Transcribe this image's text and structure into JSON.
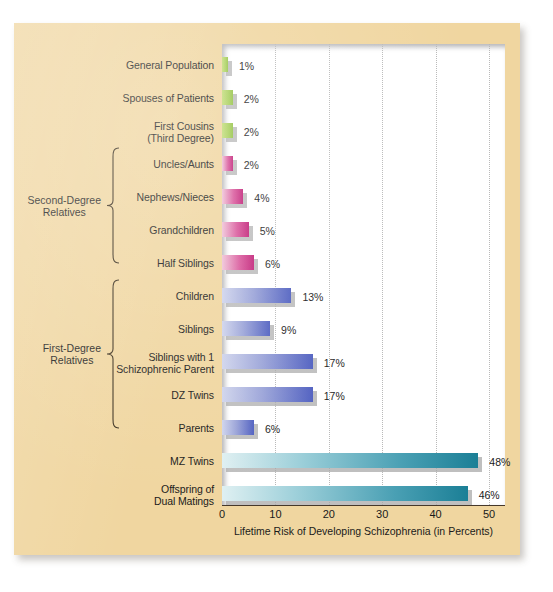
{
  "figure": {
    "background_color": "#f0d6a0",
    "plot_background_color": "#ffffff"
  },
  "axis": {
    "title": "Lifetime Risk of Developing Schizophrenia (in Percents)",
    "ticks": [
      "0",
      "10",
      "20",
      "30",
      "40",
      "50"
    ]
  },
  "groups": [
    {
      "id": "second-degree",
      "label_line1": "Second-Degree",
      "label_line2": "Relatives"
    },
    {
      "id": "first-degree",
      "label_line1": "First-Degree",
      "label_line2": "Relatives"
    }
  ],
  "chart_data": {
    "type": "bar",
    "orientation": "horizontal",
    "title": "",
    "xlabel": "Lifetime Risk of Developing Schizophrenia (in Percents)",
    "ylabel": "",
    "xlim": [
      0,
      53
    ],
    "xticks": [
      0,
      10,
      20,
      30,
      40,
      50
    ],
    "grid": true,
    "grid_axis": "x",
    "legend": "none",
    "categories": [
      "General Population",
      "Spouses of Patients",
      "First Cousins (Third Degree)",
      "Uncles/Aunts",
      "Nephews/Nieces",
      "Grandchildren",
      "Half Siblings",
      "Children",
      "Siblings",
      "Siblings with 1 Schizophrenic Parent",
      "DZ Twins",
      "Parents",
      "MZ Twins",
      "Offspring of Dual Matings"
    ],
    "values": [
      1,
      2,
      2,
      2,
      4,
      5,
      6,
      13,
      9,
      17,
      17,
      6,
      48,
      46
    ],
    "value_labels": [
      "1%",
      "2%",
      "2%",
      "2%",
      "4%",
      "5%",
      "6%",
      "13%",
      "9%",
      "17%",
      "17%",
      "6%",
      "48%",
      "46%"
    ],
    "colors": [
      "#93c244",
      "#93c244",
      "#93c244",
      "#c12077",
      "#c12077",
      "#c12077",
      "#c12077",
      "#4f5fc0",
      "#4f5fc0",
      "#4f5fc0",
      "#4f5fc0",
      "#4f5fc0",
      "#1b7f96",
      "#1b7f96"
    ]
  },
  "bars": [
    {
      "label_line1": "General Population",
      "label_line2": "",
      "value": 1,
      "value_label": "1%",
      "color_class": "c-green"
    },
    {
      "label_line1": "Spouses of Patients",
      "label_line2": "",
      "value": 2,
      "value_label": "2%",
      "color_class": "c-green"
    },
    {
      "label_line1": "First Cousins",
      "label_line2": "(Third Degree)",
      "value": 2,
      "value_label": "2%",
      "color_class": "c-green"
    },
    {
      "label_line1": "Uncles/Aunts",
      "label_line2": "",
      "value": 2,
      "value_label": "2%",
      "color_class": "c-pink"
    },
    {
      "label_line1": "Nephews/Nieces",
      "label_line2": "",
      "value": 4,
      "value_label": "4%",
      "color_class": "c-pink"
    },
    {
      "label_line1": "Grandchildren",
      "label_line2": "",
      "value": 5,
      "value_label": "5%",
      "color_class": "c-pink"
    },
    {
      "label_line1": "Half Siblings",
      "label_line2": "",
      "value": 6,
      "value_label": "6%",
      "color_class": "c-pink"
    },
    {
      "label_line1": "Children",
      "label_line2": "",
      "value": 13,
      "value_label": "13%",
      "color_class": "c-blue"
    },
    {
      "label_line1": "Siblings",
      "label_line2": "",
      "value": 9,
      "value_label": "9%",
      "color_class": "c-blue"
    },
    {
      "label_line1": "Siblings with 1",
      "label_line2": "Schizophrenic Parent",
      "value": 17,
      "value_label": "17%",
      "color_class": "c-blue"
    },
    {
      "label_line1": "DZ Twins",
      "label_line2": "",
      "value": 17,
      "value_label": "17%",
      "color_class": "c-blue"
    },
    {
      "label_line1": "Parents",
      "label_line2": "",
      "value": 6,
      "value_label": "6%",
      "color_class": "c-blue"
    },
    {
      "label_line1": "MZ Twins",
      "label_line2": "",
      "value": 48,
      "value_label": "48%",
      "color_class": "c-teal"
    },
    {
      "label_line1": "Offspring of",
      "label_line2": "Dual Matings",
      "value": 46,
      "value_label": "46%",
      "color_class": "c-teal"
    }
  ]
}
